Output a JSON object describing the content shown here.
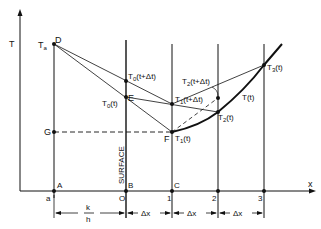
{
  "diagram": {
    "type": "finite-difference heat conduction schematic",
    "axes": {
      "y_label": "T",
      "x_label": "x"
    },
    "points": {
      "Ta_label": "T",
      "Ta_sub": "a",
      "D": "D",
      "E": "E",
      "F": "F",
      "G": "G",
      "A": "A",
      "B": "B",
      "C": "C"
    },
    "node_labels": {
      "T0_t_plus": {
        "base": "T",
        "sub": "0",
        "arg": "(t+Δt)"
      },
      "T0_t": {
        "base": "T",
        "sub": "0",
        "arg": "(t)"
      },
      "T1_t_plus": {
        "base": "T",
        "sub": "1",
        "arg": "(t+Δt)"
      },
      "T1_t": {
        "base": "T",
        "sub": "1",
        "arg": "(t)"
      },
      "T2_t_plus": {
        "base": "T",
        "sub": "2",
        "arg": "(t+Δt)"
      },
      "T2_t": {
        "base": "T",
        "sub": "2",
        "arg": "(t)"
      },
      "T3_t": {
        "base": "T",
        "sub": "3",
        "arg": "(t)"
      },
      "Tt": "T(t)"
    },
    "x_ticks": [
      "a",
      "O",
      "1",
      "2",
      "3"
    ],
    "surface_label": "SURFACE",
    "dimensions": {
      "k_over_h_num": "k",
      "k_over_h_den": "h",
      "dx1": "Δx",
      "dx2": "Δx",
      "dx3": "Δx"
    }
  }
}
